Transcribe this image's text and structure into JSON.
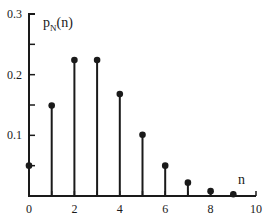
{
  "chart_data": {
    "type": "stem",
    "title": "",
    "ylabel": "p",
    "ylabel_subscript": "N",
    "ylabel_suffix": "(n)",
    "xlabel": "n",
    "xlim": [
      0,
      10
    ],
    "ylim": [
      0,
      0.3
    ],
    "grid": false,
    "x_ticks": [
      0,
      2,
      4,
      6,
      8,
      10
    ],
    "x_minor_ticks": [
      1,
      3,
      5,
      7,
      9
    ],
    "x_tick_labels": [
      "0",
      "2",
      "4",
      "6",
      "8",
      "10"
    ],
    "y_ticks": [
      0.1,
      0.2,
      0.3
    ],
    "y_minor_ticks": [
      0.05,
      0.15,
      0.25
    ],
    "y_tick_labels": [
      "0.1",
      "0.2",
      "0.3"
    ],
    "x": [
      0,
      1,
      2,
      3,
      4,
      5,
      6,
      7,
      8,
      9
    ],
    "values": [
      0.05,
      0.149,
      0.224,
      0.224,
      0.168,
      0.101,
      0.05,
      0.022,
      0.008,
      0.003
    ],
    "color": "#1a1a1a"
  }
}
